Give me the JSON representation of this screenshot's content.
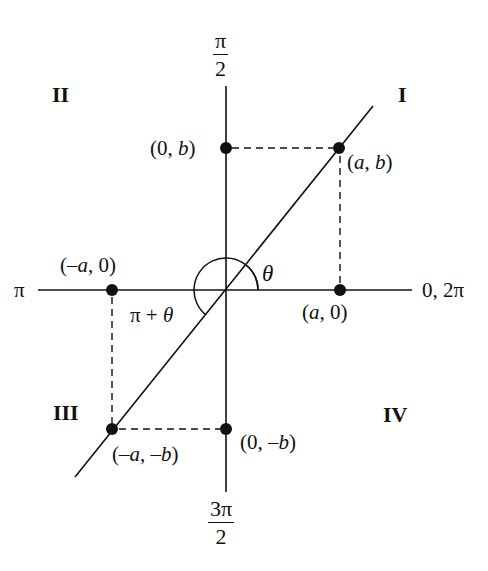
{
  "diagram": {
    "type": "polar-angle-quadrant-diagram",
    "axis_angle_labels": {
      "top": {
        "numerator": "π",
        "denominator": "2"
      },
      "bottom": {
        "numerator": "3π",
        "denominator": "2"
      },
      "left": "π",
      "right": "0, 2π"
    },
    "quadrants": [
      "I",
      "II",
      "III",
      "IV"
    ],
    "points": [
      {
        "label_pre": "(",
        "label_a": "a",
        "label_mid": ", ",
        "label_b": "b",
        "label_post": ")"
      },
      {
        "label_pre": "(0, ",
        "label_b": "b",
        "label_post": ")"
      },
      {
        "label_pre": "(–",
        "label_a": "a",
        "label_post": ", 0)"
      },
      {
        "label_pre": "(",
        "label_a": "a",
        "label_post": ", 0)"
      },
      {
        "label_pre": "(–",
        "label_a": "a",
        "label_mid": ", –",
        "label_b": "b",
        "label_post": ")"
      },
      {
        "label_pre": "(0, –",
        "label_b": "b",
        "label_post": ")"
      }
    ],
    "angles": {
      "theta": "θ",
      "pi_plus_theta_pre": "π + ",
      "pi_plus_theta_var": "θ"
    },
    "colors": {
      "ink": "#111111",
      "background": "#ffffff"
    }
  }
}
